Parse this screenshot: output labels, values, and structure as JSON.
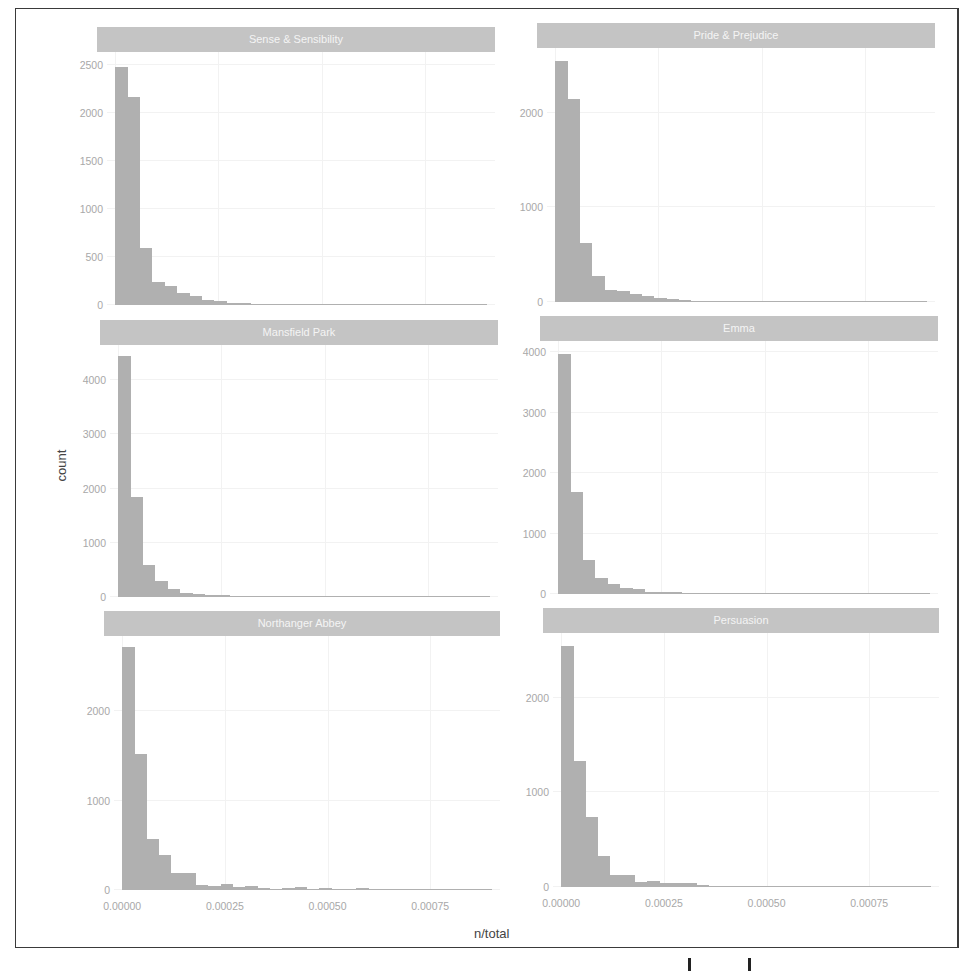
{
  "figure": {
    "xlabel": "n/total",
    "ylabel": "count",
    "x_ticks": [
      "0.00000",
      "0.00025",
      "0.00050",
      "0.00075"
    ],
    "x_tick_values": [
      0,
      0.00025,
      0.0005,
      0.00075
    ],
    "bar_color": "#b0b0b0",
    "strip_color": "#c4c4c4"
  },
  "chart_data": {
    "type": "bar",
    "subtype": "faceted histogram",
    "title": "",
    "xlabel": "n/total",
    "ylabel": "count",
    "xlim": [
      -2e-05,
      0.00092
    ],
    "bin_width": 3e-05,
    "grid": true,
    "facets": [
      {
        "name": "Sense & Sensibility",
        "ylim": [
          0,
          2550
        ],
        "y_ticks": [
          0,
          500,
          1000,
          1500,
          2000,
          2500
        ],
        "values": [
          2480,
          2160,
          590,
          240,
          200,
          120,
          90,
          50,
          40,
          25,
          20,
          15,
          12,
          10,
          8,
          6,
          5,
          4,
          4,
          3,
          3,
          2,
          2,
          2,
          2,
          1,
          1,
          2,
          1,
          1
        ]
      },
      {
        "name": "Pride & Prejudice",
        "ylim": [
          0,
          2600
        ],
        "y_ticks": [
          0,
          1000,
          2000
        ],
        "values": [
          2550,
          2150,
          620,
          280,
          130,
          120,
          90,
          60,
          40,
          30,
          20,
          15,
          12,
          10,
          8,
          6,
          5,
          4,
          3,
          3,
          2,
          2,
          2,
          3,
          2,
          1,
          1,
          2,
          1,
          1
        ]
      },
      {
        "name": "Mansfield Park",
        "ylim": [
          0,
          4500
        ],
        "y_ticks": [
          0,
          1000,
          2000,
          3000,
          4000
        ],
        "values": [
          4450,
          1850,
          590,
          300,
          150,
          80,
          50,
          40,
          30,
          25,
          20,
          20,
          15,
          12,
          10,
          8,
          6,
          5,
          4,
          3,
          3,
          2,
          2,
          2,
          1,
          1,
          1,
          1,
          1,
          1
        ]
      },
      {
        "name": "Emma",
        "ylim": [
          0,
          4050
        ],
        "y_ticks": [
          0,
          1000,
          2000,
          3000,
          4000
        ],
        "values": [
          3970,
          1690,
          570,
          270,
          170,
          100,
          90,
          40,
          30,
          40,
          25,
          20,
          15,
          20,
          12,
          10,
          8,
          6,
          5,
          4,
          4,
          3,
          3,
          2,
          2,
          2,
          1,
          1,
          1,
          1
        ]
      },
      {
        "name": "Northanger Abbey",
        "ylim": [
          0,
          2750
        ],
        "y_ticks": [
          0,
          1000,
          2000
        ],
        "values": [
          2720,
          1520,
          570,
          390,
          190,
          190,
          60,
          50,
          70,
          30,
          40,
          20,
          15,
          20,
          30,
          15,
          25,
          15,
          10,
          20,
          10,
          8,
          8,
          6,
          5,
          4,
          3,
          3,
          2,
          2
        ]
      },
      {
        "name": "Persuasion",
        "ylim": [
          0,
          2600
        ],
        "y_ticks": [
          0,
          1000,
          2000
        ],
        "values": [
          2550,
          1330,
          740,
          330,
          130,
          130,
          50,
          60,
          40,
          45,
          45,
          20,
          15,
          15,
          12,
          10,
          8,
          8,
          6,
          5,
          5,
          4,
          3,
          3,
          2,
          2,
          2,
          1,
          1,
          1
        ]
      }
    ]
  }
}
